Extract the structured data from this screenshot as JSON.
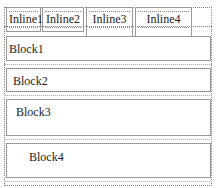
{
  "inlines": [
    {
      "label": "Inline1"
    },
    {
      "label": "Inline2"
    },
    {
      "label": "Inline3"
    },
    {
      "label": "Inline4"
    }
  ],
  "blocks": [
    {
      "label": "Block1"
    },
    {
      "label": "Block2"
    },
    {
      "label": "Block3"
    },
    {
      "label": "Block4"
    }
  ],
  "colors": {
    "border": "#999999",
    "dotted": "#888888",
    "text": "#222222"
  }
}
